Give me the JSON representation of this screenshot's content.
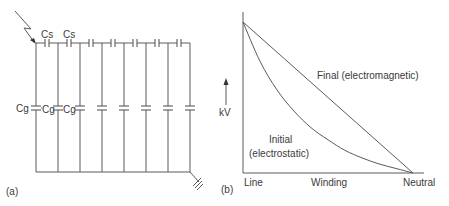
{
  "figure": {
    "panel_a": {
      "label": "(a)",
      "series_capacitor_label": "Cs",
      "ground_capacitor_label": "Cg",
      "sections": 8,
      "labeled_series_caps": 2,
      "labeled_ground_caps": 3,
      "surge_icon": "lightning-arrow-icon",
      "ground_icon": "earth-ground-icon"
    },
    "panel_b": {
      "label": "(b)",
      "y_axis_label": "kV",
      "x_tick_labels": [
        "Line",
        "Winding",
        "Neutral"
      ],
      "curve_labels": {
        "final": "Final (electromagnetic)",
        "initial_line1": "Initial",
        "initial_line2": "(electrostatic)"
      }
    }
  },
  "chart_data": {
    "type": "line",
    "title": "",
    "xlabel": "Winding",
    "ylabel": "kV",
    "x_categories": [
      "Line",
      "Winding",
      "Neutral"
    ],
    "xlim": [
      0,
      1
    ],
    "ylim": [
      0,
      1
    ],
    "grid": false,
    "series": [
      {
        "name": "Final (electromagnetic)",
        "x": [
          0,
          1
        ],
        "y": [
          1,
          0
        ]
      },
      {
        "name": "Initial (electrostatic)",
        "x": [
          0,
          0.1,
          0.2,
          0.3,
          0.4,
          0.5,
          0.6,
          0.7,
          0.8,
          0.9,
          1.0
        ],
        "y": [
          1,
          0.74,
          0.55,
          0.41,
          0.3,
          0.22,
          0.15,
          0.1,
          0.06,
          0.03,
          0
        ]
      }
    ]
  }
}
